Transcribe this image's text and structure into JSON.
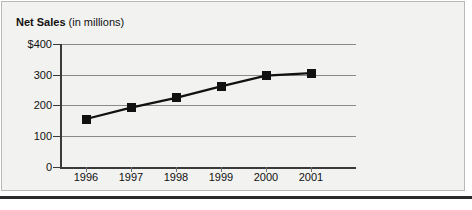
{
  "chart_data": {
    "type": "line",
    "title": "Net Sales (in millions)",
    "title_bold_part": "Net Sales",
    "title_regular_part": "(in millions)",
    "xlabel": "",
    "ylabel": "",
    "categories": [
      "1996",
      "1997",
      "1998",
      "1999",
      "2000",
      "2001"
    ],
    "values": [
      156,
      193,
      225,
      262,
      297,
      305
    ],
    "series": [
      {
        "name": "Net Sales",
        "values": [
          156,
          193,
          225,
          262,
          297,
          305
        ]
      }
    ],
    "ylim": [
      0,
      400
    ],
    "ytick_labels": [
      "$400",
      "300",
      "200",
      "100",
      "0"
    ],
    "ytick_values": [
      400,
      300,
      200,
      100,
      0
    ],
    "grid": true,
    "legend": "none",
    "marker": "square",
    "line_color": "#111111",
    "marker_color": "#111111",
    "grid_color": "#8a8a88",
    "panel_color": "#f2f2f0"
  }
}
